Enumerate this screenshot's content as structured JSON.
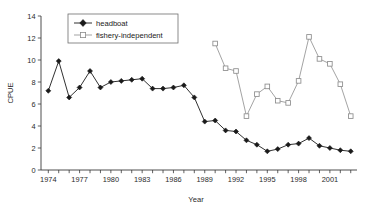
{
  "chart_data": {
    "type": "line",
    "title": "",
    "xlabel": "Year",
    "ylabel": "CPUE",
    "xlim": [
      1973.3,
      2003.6
    ],
    "ylim": [
      0,
      14
    ],
    "ytick_step": 2,
    "yticks": [
      0,
      2,
      4,
      6,
      8,
      10,
      12,
      14
    ],
    "ytick_labels": [
      "0",
      "2",
      "4",
      "6",
      "8",
      "10",
      "12",
      "14"
    ],
    "xticks": [
      1974,
      1975,
      1976,
      1977,
      1978,
      1979,
      1980,
      1981,
      1982,
      1983,
      1984,
      1985,
      1986,
      1987,
      1988,
      1989,
      1990,
      1991,
      1992,
      1993,
      1994,
      1995,
      1996,
      1997,
      1998,
      1999,
      2000,
      2001,
      2002,
      2003
    ],
    "xtick_labels_shown": [
      "1974",
      "1977",
      "1980",
      "1983",
      "1986",
      "1989",
      "1992",
      "1995",
      "1998",
      "2001"
    ],
    "xtick_label_years": [
      1974,
      1977,
      1980,
      1983,
      1986,
      1989,
      1992,
      1995,
      1998,
      2001
    ],
    "grid": false,
    "legend_position": "top-left-inside",
    "series": [
      {
        "name": "headboat",
        "color": "#1a1a1a",
        "marker": "filled-diamond",
        "x": [
          1974,
          1975,
          1976,
          1977,
          1978,
          1979,
          1980,
          1981,
          1982,
          1983,
          1984,
          1985,
          1986,
          1987,
          1988,
          1989,
          1990,
          1991,
          1992,
          1993,
          1994,
          1995,
          1996,
          1997,
          1998,
          1999,
          2000,
          2001,
          2002,
          2003
        ],
        "values": [
          7.2,
          9.9,
          6.6,
          7.5,
          9.0,
          7.5,
          8.0,
          8.1,
          8.2,
          8.3,
          7.4,
          7.4,
          7.5,
          7.7,
          6.6,
          4.4,
          4.5,
          3.6,
          3.5,
          2.7,
          2.3,
          1.7,
          1.9,
          2.3,
          2.4,
          2.9,
          2.2,
          2.0,
          1.8,
          1.7
        ]
      },
      {
        "name": "fishery-independent",
        "color": "#999999",
        "marker": "open-square",
        "x": [
          1990,
          1991,
          1992,
          1993,
          1994,
          1995,
          1996,
          1997,
          1998,
          1999,
          2000,
          2001,
          2002,
          2003
        ],
        "values": [
          11.5,
          9.25,
          9.0,
          4.9,
          6.9,
          7.6,
          6.3,
          6.1,
          8.1,
          12.1,
          10.1,
          9.65,
          7.8,
          4.9
        ]
      }
    ]
  },
  "legend": {
    "entries": [
      {
        "label": "headboat"
      },
      {
        "label": "fishery-independent"
      }
    ]
  },
  "axes": {
    "y_title": "CPUE",
    "x_title": "Year"
  }
}
